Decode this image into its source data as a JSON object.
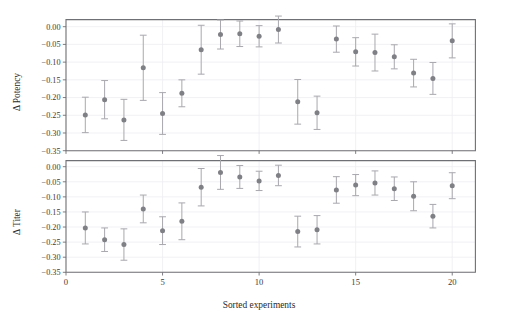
{
  "figure": {
    "background_color": "#ffffff",
    "marker_color": "#7f7f86",
    "errorbar_color": "#a8a8ae",
    "grid_color": "#ededf2",
    "frame_color": "#6f6f76",
    "xlabel": "Sorted experiments"
  },
  "chart_data": [
    {
      "type": "scatter",
      "panel": "top",
      "title": "",
      "xlabel": "",
      "ylabel": "Δ Potency",
      "xlim": [
        0,
        21.2
      ],
      "ylim": [
        -0.35,
        0.02
      ],
      "grid": true,
      "legend": null,
      "xticks": [
        0,
        5,
        10,
        15,
        20
      ],
      "xtick_labels": [
        "0",
        "5",
        "10",
        "15",
        "20"
      ],
      "yticks": [
        0.0,
        -0.05,
        -0.1,
        -0.15,
        -0.2,
        -0.25,
        -0.3,
        -0.35
      ],
      "ytick_labels": [
        "0.00",
        "−0.05",
        "−0.10",
        "−0.15",
        "−0.20",
        "−0.25",
        "−0.30",
        "−0.35"
      ],
      "x": [
        1,
        2,
        3,
        4,
        5,
        6,
        7,
        8,
        9,
        10,
        11,
        12,
        13,
        14,
        15,
        16,
        17,
        18,
        19,
        20
      ],
      "values": [
        -0.249,
        -0.206,
        -0.263,
        -0.116,
        -0.245,
        -0.188,
        -0.065,
        -0.022,
        -0.02,
        -0.027,
        -0.008,
        -0.212,
        -0.243,
        -0.035,
        -0.071,
        -0.073,
        -0.085,
        -0.131,
        -0.146,
        -0.04
      ],
      "yerr_lower": [
        0.05,
        0.054,
        0.058,
        0.092,
        0.059,
        0.038,
        0.069,
        0.041,
        0.036,
        0.03,
        0.038,
        0.063,
        0.047,
        0.037,
        0.04,
        0.052,
        0.034,
        0.039,
        0.045,
        0.048
      ],
      "yerr_upper": [
        0.05,
        0.054,
        0.058,
        0.092,
        0.059,
        0.038,
        0.069,
        0.041,
        0.036,
        0.03,
        0.038,
        0.063,
        0.047,
        0.037,
        0.04,
        0.052,
        0.034,
        0.039,
        0.045,
        0.048
      ]
    },
    {
      "type": "scatter",
      "panel": "bottom",
      "title": "",
      "xlabel": "Sorted experiments",
      "ylabel": "Δ Titer",
      "xlim": [
        0,
        21.2
      ],
      "ylim": [
        -0.35,
        0.02
      ],
      "grid": true,
      "legend": null,
      "xticks": [
        0,
        5,
        10,
        15,
        20
      ],
      "xtick_labels": [
        "0",
        "5",
        "10",
        "15",
        "20"
      ],
      "yticks": [
        0.0,
        -0.05,
        -0.1,
        -0.15,
        -0.2,
        -0.25,
        -0.3,
        -0.35
      ],
      "ytick_labels": [
        "0.00",
        "−0.05",
        "−0.10",
        "−0.15",
        "−0.20",
        "−0.25",
        "−0.30",
        "−0.35"
      ],
      "x": [
        1,
        2,
        3,
        4,
        5,
        6,
        7,
        8,
        9,
        10,
        11,
        12,
        13,
        14,
        15,
        16,
        17,
        18,
        19,
        20
      ],
      "values": [
        -0.203,
        -0.242,
        -0.258,
        -0.14,
        -0.212,
        -0.181,
        -0.068,
        -0.019,
        -0.034,
        -0.047,
        -0.029,
        -0.215,
        -0.209,
        -0.077,
        -0.061,
        -0.054,
        -0.073,
        -0.098,
        -0.164,
        -0.063
      ],
      "yerr_lower": [
        0.053,
        0.039,
        0.052,
        0.046,
        0.046,
        0.061,
        0.062,
        0.056,
        0.038,
        0.032,
        0.034,
        0.051,
        0.047,
        0.044,
        0.035,
        0.04,
        0.039,
        0.048,
        0.039,
        0.043
      ],
      "yerr_upper": [
        0.053,
        0.039,
        0.052,
        0.046,
        0.046,
        0.061,
        0.062,
        0.056,
        0.038,
        0.032,
        0.034,
        0.051,
        0.047,
        0.044,
        0.035,
        0.04,
        0.039,
        0.048,
        0.039,
        0.043
      ]
    }
  ]
}
